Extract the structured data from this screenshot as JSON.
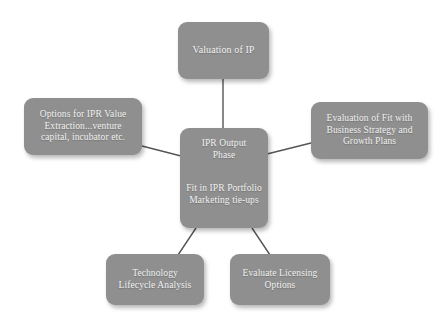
{
  "diagram": {
    "type": "radial-hub-and-spoke",
    "background_color": "#ffffff",
    "node_fill_color": "#8f8f8f",
    "node_text_color": "#f2f2f2",
    "connector_color": "#555555",
    "center": {
      "id": "center",
      "heading_lines": [
        "IPR Output",
        "Phase"
      ],
      "body_lines": [
        "Fit in IPR Portfolio",
        "Marketing tie-ups"
      ]
    },
    "nodes": [
      {
        "id": "valuation-of-ip",
        "position": "top",
        "lines": [
          "Valuation of IP"
        ]
      },
      {
        "id": "options-for-ipr-value-extraction",
        "position": "left",
        "lines": [
          "Options for IPR Value",
          "Extraction...venture",
          "capital, incubator etc."
        ]
      },
      {
        "id": "evaluation-of-fit",
        "position": "right",
        "lines": [
          "Evaluation of Fit with",
          "Business Strategy and",
          "Growth Plans"
        ]
      },
      {
        "id": "technology-lifecycle-analysis",
        "position": "bottom-left",
        "lines": [
          "Technology",
          "Lifecycle Analysis"
        ]
      },
      {
        "id": "evaluate-licensing-options",
        "position": "bottom-right",
        "lines": [
          "Evaluate Licensing",
          "Options"
        ]
      }
    ],
    "edges": [
      {
        "from": "center",
        "to": "valuation-of-ip"
      },
      {
        "from": "center",
        "to": "options-for-ipr-value-extraction"
      },
      {
        "from": "center",
        "to": "evaluation-of-fit"
      },
      {
        "from": "center",
        "to": "technology-lifecycle-analysis"
      },
      {
        "from": "center",
        "to": "evaluate-licensing-options"
      }
    ]
  }
}
